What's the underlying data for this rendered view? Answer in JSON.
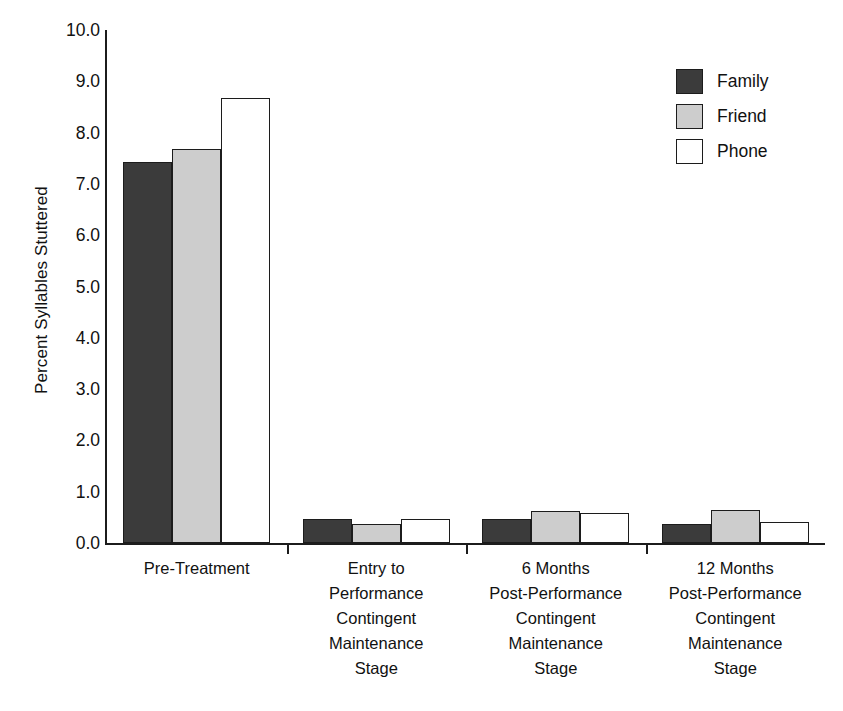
{
  "chart_data": {
    "type": "bar",
    "title": "",
    "xlabel": "",
    "ylabel": "Percent Syllables Stuttered",
    "ylim": [
      0.0,
      10.0
    ],
    "ytick_step": 1.0,
    "ytick_labels": [
      "0.0",
      "1.0",
      "2.0",
      "3.0",
      "4.0",
      "5.0",
      "6.0",
      "7.0",
      "8.0",
      "9.0",
      "10.0"
    ],
    "ytick_values": [
      0.0,
      1.0,
      2.0,
      3.0,
      4.0,
      5.0,
      6.0,
      7.0,
      8.0,
      9.0,
      10.0
    ],
    "grid": false,
    "legend_position": "top-right",
    "categories": [
      "Pre-Treatment",
      "Entry to Performance Contingent Maintenance Stage",
      "6 Months Post-Performance Contingent Maintenance Stage",
      "12 Months Post-Performance Contingent Maintenance Stage"
    ],
    "category_lines": [
      [
        "Pre-Treatment"
      ],
      [
        "Entry to",
        "Performance",
        "Contingent",
        "Maintenance",
        "Stage"
      ],
      [
        "6 Months",
        "Post-Performance",
        "Contingent",
        "Maintenance",
        "Stage"
      ],
      [
        "12 Months",
        "Post-Performance",
        "Contingent",
        "Maintenance",
        "Stage"
      ]
    ],
    "series": [
      {
        "name": "Family",
        "color": "#3b3b3b",
        "values": [
          7.42,
          0.47,
          0.47,
          0.37
        ]
      },
      {
        "name": "Friend",
        "color": "#cdcdcd",
        "values": [
          7.68,
          0.37,
          0.63,
          0.65
        ]
      },
      {
        "name": "Phone",
        "color": "#ffffff",
        "values": [
          8.67,
          0.47,
          0.58,
          0.41
        ]
      }
    ]
  },
  "legend": {
    "entries": [
      {
        "label": "Family",
        "color": "#3b3b3b"
      },
      {
        "label": "Friend",
        "color": "#cdcdcd"
      },
      {
        "label": "Phone",
        "color": "#ffffff"
      }
    ]
  },
  "axes": {
    "y_title": "Percent Syllables Stuttered",
    "edge_color": "#1c1c1c"
  }
}
